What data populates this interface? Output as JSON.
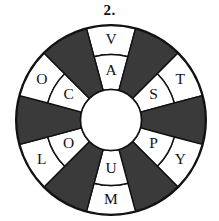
{
  "figure": {
    "number_label": "2.",
    "type": "puzzle-wheel",
    "colors": {
      "dark_sector": "#3a3a3a",
      "light_sector": "#ffffff",
      "outline": "#111111",
      "text": "#111111",
      "background": "#ffffff"
    }
  },
  "wheel": {
    "sector_count": 12,
    "sector_angle_degrees": 30,
    "ring_count": 2,
    "hub_label": "",
    "sectors": [
      {
        "index": 0,
        "fill": "light",
        "center_angle": 0,
        "outer_letter": "V",
        "inner_letter": "A"
      },
      {
        "index": 1,
        "fill": "dark",
        "center_angle": 30,
        "outer_letter": "",
        "inner_letter": ""
      },
      {
        "index": 2,
        "fill": "light",
        "center_angle": 60,
        "outer_letter": "T",
        "inner_letter": "S"
      },
      {
        "index": 3,
        "fill": "dark",
        "center_angle": 90,
        "outer_letter": "",
        "inner_letter": ""
      },
      {
        "index": 4,
        "fill": "light",
        "center_angle": 120,
        "outer_letter": "Y",
        "inner_letter": "P"
      },
      {
        "index": 5,
        "fill": "dark",
        "center_angle": 150,
        "outer_letter": "",
        "inner_letter": ""
      },
      {
        "index": 6,
        "fill": "light",
        "center_angle": 180,
        "outer_letter": "M",
        "inner_letter": "U"
      },
      {
        "index": 7,
        "fill": "dark",
        "center_angle": 210,
        "outer_letter": "",
        "inner_letter": ""
      },
      {
        "index": 8,
        "fill": "light",
        "center_angle": 240,
        "outer_letter": "L",
        "inner_letter": "O"
      },
      {
        "index": 9,
        "fill": "dark",
        "center_angle": 270,
        "outer_letter": "",
        "inner_letter": ""
      },
      {
        "index": 10,
        "fill": "light",
        "center_angle": 300,
        "outer_letter": "O",
        "inner_letter": "C"
      },
      {
        "index": 11,
        "fill": "dark",
        "center_angle": 330,
        "outer_letter": "",
        "inner_letter": ""
      }
    ],
    "letters_outer_ring": [
      "V",
      "T",
      "Y",
      "M",
      "L",
      "O"
    ],
    "letters_inner_ring": [
      "A",
      "S",
      "P",
      "U",
      "O",
      "C"
    ]
  }
}
